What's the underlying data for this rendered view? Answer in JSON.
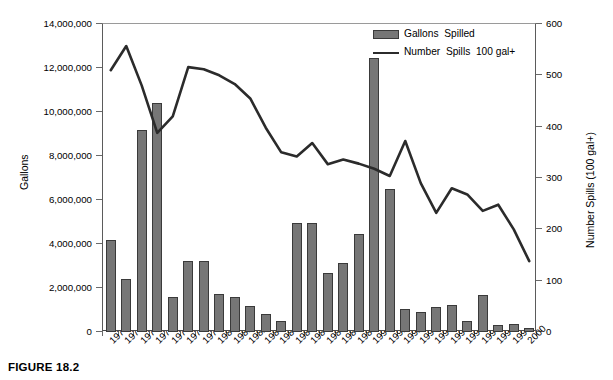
{
  "figure": {
    "caption": "FIGURE 18.2"
  },
  "legend": {
    "position": "top-right",
    "items": [
      {
        "name": "bar-series",
        "label": "Gallons  Spilled",
        "marker": "bar-swatch",
        "color": "#767676"
      },
      {
        "name": "line-series",
        "label": "Number  Spills  100 gal+",
        "marker": "line-swatch",
        "color": "#2b2b2b"
      }
    ]
  },
  "axes": {
    "left": {
      "label": "Gallons",
      "min": 0,
      "max": 14000000,
      "step": 2000000,
      "ticks": [
        "0",
        "2,000,000",
        "4,000,000",
        "6,000,000",
        "8,000,000",
        "10,000,000",
        "12,000,000",
        "14,000,000"
      ]
    },
    "right": {
      "label": "Number Spills (100 gal+)",
      "min": 0,
      "max": 600,
      "step": 100,
      "ticks": [
        "0",
        "100",
        "200",
        "300",
        "400",
        "500",
        "600"
      ]
    },
    "bottom": {
      "label": "",
      "ticks": [
        "1973",
        "1974",
        "1975",
        "1976",
        "1977",
        "1978",
        "1979",
        "1980",
        "1981",
        "1982",
        "1983",
        "1984",
        "1985",
        "1986",
        "1987",
        "1988",
        "1989",
        "1990",
        "1991",
        "1992",
        "1993",
        "1994",
        "1995",
        "1996",
        "1997",
        "1998",
        "1999",
        "2000"
      ]
    }
  },
  "chart_data": {
    "type": "bar",
    "title": "",
    "subtitle": "",
    "xlabel": "",
    "ylabel": "Gallons",
    "ylabel_secondary": "Number Spills (100 gal+)",
    "ylim": [
      0,
      14000000
    ],
    "ylim_secondary": [
      0,
      600
    ],
    "grid": false,
    "legend_position": "top-right",
    "categories": [
      "1973",
      "1974",
      "1975",
      "1976",
      "1977",
      "1978",
      "1979",
      "1980",
      "1981",
      "1982",
      "1983",
      "1984",
      "1985",
      "1986",
      "1987",
      "1988",
      "1989",
      "1990",
      "1991",
      "1992",
      "1993",
      "1994",
      "1995",
      "1996",
      "1997",
      "1998",
      "1999",
      "2000"
    ],
    "series": [
      {
        "name": "Gallons  Spilled",
        "type": "bar",
        "axis": "left",
        "color": "#767676",
        "values": [
          4200000,
          2400000,
          9200000,
          10400000,
          1600000,
          3250000,
          3250000,
          1750000,
          1600000,
          1200000,
          800000,
          500000,
          4950000,
          4950000,
          2700000,
          3150000,
          4450000,
          12450000,
          6500000,
          1050000,
          900000,
          1150000,
          1250000,
          500000,
          1700000,
          300000,
          350000,
          200000
        ]
      },
      {
        "name": "Number  Spills  100 gal+",
        "type": "line",
        "axis": "right",
        "color": "#2b2b2b",
        "values": [
          510,
          557,
          480,
          388,
          420,
          516,
          512,
          500,
          483,
          455,
          398,
          350,
          342,
          368,
          327,
          336,
          328,
          318,
          304,
          372,
          290,
          232,
          280,
          268,
          236,
          248,
          200,
          138
        ]
      }
    ]
  }
}
